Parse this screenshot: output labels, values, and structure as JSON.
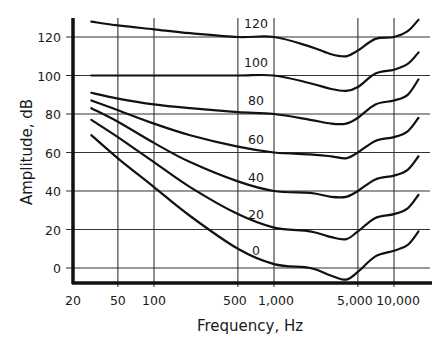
{
  "chart_data": {
    "type": "line",
    "title": "",
    "xlabel": "Frequency, Hz",
    "ylabel": "Amplitude, dB",
    "xscale": "log",
    "xlim": [
      20,
      20000
    ],
    "ylim": [
      -10,
      130
    ],
    "x_ticks": [
      {
        "value": 20,
        "label": "20"
      },
      {
        "value": 50,
        "label": "50"
      },
      {
        "value": 100,
        "label": "100"
      },
      {
        "value": 500,
        "label": "500"
      },
      {
        "value": 1000,
        "label": "1,000"
      },
      {
        "value": 5000,
        "label": "5,000"
      },
      {
        "value": 10000,
        "label": "10,000"
      }
    ],
    "y_ticks": [
      {
        "value": 0,
        "label": "0"
      },
      {
        "value": 20,
        "label": "20"
      },
      {
        "value": 40,
        "label": "40"
      },
      {
        "value": 60,
        "label": "60"
      },
      {
        "value": 80,
        "label": "80"
      },
      {
        "value": 100,
        "label": "100"
      },
      {
        "value": 120,
        "label": "120"
      }
    ],
    "grid": true,
    "legend": "inline curve labels near 1,000 Hz",
    "x": [
      30,
      50,
      100,
      200,
      500,
      1000,
      2000,
      3000,
      4000,
      5000,
      7000,
      10000,
      13000,
      16000
    ],
    "series": [
      {
        "name": "120",
        "label": "120",
        "values": [
          128,
          126,
          124,
          122,
          120,
          120,
          115,
          111,
          110,
          113,
          119,
          120,
          123,
          129
        ]
      },
      {
        "name": "100",
        "label": "100",
        "values": [
          100,
          100,
          100,
          100,
          100,
          100,
          96,
          93,
          92,
          94,
          101,
          103,
          106,
          112
        ]
      },
      {
        "name": "80",
        "label": "80",
        "values": [
          91,
          88,
          85,
          83,
          81,
          80,
          77,
          75,
          75,
          78,
          85,
          87,
          90,
          98
        ]
      },
      {
        "name": "60",
        "label": "60",
        "values": [
          87,
          82,
          75,
          69,
          63,
          60,
          59,
          58,
          57,
          60,
          66,
          68,
          71,
          78
        ]
      },
      {
        "name": "40",
        "label": "40",
        "values": [
          83,
          76,
          65,
          55,
          45,
          40,
          39,
          37,
          37,
          40,
          46,
          48,
          51,
          58
        ]
      },
      {
        "name": "20",
        "label": "20",
        "values": [
          77,
          68,
          55,
          42,
          28,
          21,
          19,
          16,
          15,
          19,
          26,
          28,
          31,
          38
        ]
      },
      {
        "name": "0",
        "label": "0",
        "values": [
          69,
          57,
          42,
          27,
          10,
          2,
          0,
          -4,
          -6,
          -2,
          6,
          9,
          12,
          19
        ]
      }
    ]
  }
}
